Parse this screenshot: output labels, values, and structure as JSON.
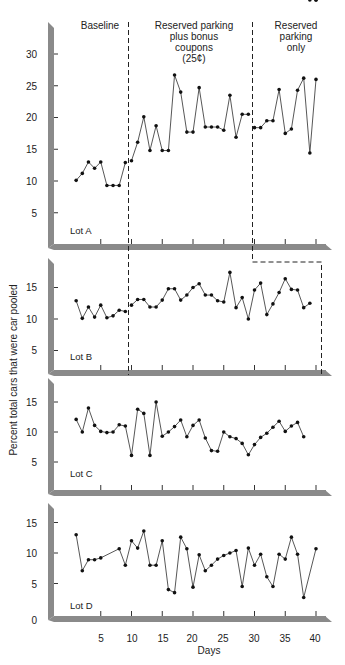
{
  "chart_data": {
    "type": "line",
    "title": "",
    "xlabel": "Days",
    "ylabel": "Percent total cars that were car pooled",
    "x_ticks": [
      5,
      10,
      15,
      20,
      25,
      30,
      35,
      40
    ],
    "phases": [
      {
        "label": "Baseline",
        "lines": [
          "Baseline"
        ]
      },
      {
        "label": "Reserved parking plus bonus coupons (25¢)",
        "lines": [
          "Reserved parking",
          "plus bonus",
          "coupons",
          "(25¢)"
        ]
      },
      {
        "label": "Reserved parking only",
        "lines": [
          "Reserved",
          "parking",
          "only"
        ]
      }
    ],
    "panels": [
      {
        "name": "Lot A",
        "y_ticks": [
          5,
          10,
          15,
          20,
          25,
          30
        ],
        "ylim": [
          0,
          35
        ],
        "phase_break_1": 9.5,
        "phase_break_2": 29.7,
        "series": [
          {
            "phase": "Baseline",
            "x": [
              1,
              2,
              3,
              4,
              5,
              6,
              7,
              8,
              9
            ],
            "y": [
              10.1,
              11.2,
              13.0,
              12.0,
              13.0,
              9.3,
              9.3,
              9.3,
              12.9
            ]
          },
          {
            "phase": "Reserved parking plus bonus coupons",
            "x": [
              10,
              11,
              12,
              13,
              14,
              15,
              16,
              17,
              18,
              19,
              20,
              21,
              22,
              23,
              24,
              25,
              26,
              27,
              28,
              29
            ],
            "y": [
              13.2,
              16.1,
              20.1,
              14.8,
              18.7,
              14.8,
              14.8,
              26.7,
              24.0,
              17.7,
              17.7,
              24.7,
              18.5,
              18.5,
              18.5,
              18.0,
              23.5,
              16.9,
              20.5,
              20.5
            ]
          },
          {
            "phase": "Reserved parking only",
            "x": [
              30,
              31,
              32,
              33,
              34,
              35,
              36,
              37,
              38,
              39,
              40
            ],
            "y": [
              18.4,
              18.4,
              19.5,
              19.5,
              24.4,
              17.5,
              18.2,
              24.3,
              26.2,
              14.4,
              26.0
            ]
          }
        ]
      },
      {
        "name": "Lot B",
        "y_ticks": [
          5,
          10,
          15
        ],
        "ylim": [
          0,
          18
        ],
        "phase_break_1": 9.5,
        "phase_break_2": 40.5,
        "series": [
          {
            "phase": "Baseline",
            "x": [
              1,
              2,
              3,
              4,
              5,
              6,
              7,
              8,
              9
            ],
            "y": [
              12.9,
              10.1,
              11.9,
              10.3,
              12.2,
              10.2,
              10.5,
              11.4,
              11.2
            ]
          },
          {
            "phase": "Reserved parking plus bonus coupons",
            "x": [
              10,
              11,
              12,
              13,
              14,
              15,
              16,
              17,
              18,
              19,
              20,
              21,
              22,
              23,
              24,
              25,
              26,
              27,
              28,
              29,
              30,
              31,
              32,
              33,
              34,
              35,
              36,
              37,
              38,
              39,
              40
            ],
            "y": [
              12.2,
              13.1,
              13.1,
              11.9,
              11.9,
              13.0,
              14.8,
              14.8,
              13.0,
              13.8,
              15.0,
              15.6,
              13.8,
              13.8,
              12.9,
              12.7,
              17.4,
              11.8,
              13.4,
              10.0,
              14.6,
              15.7,
              10.7,
              12.4,
              14.2,
              16.4,
              14.7,
              14.6,
              11.8,
              12.5
            ]
          }
        ]
      },
      {
        "name": "Lot C",
        "y_ticks": [
          5,
          10,
          15
        ],
        "ylim": [
          0,
          18
        ],
        "series": [
          {
            "phase": "all",
            "x": [
              1,
              2,
              3,
              4,
              5,
              6,
              7,
              8,
              9,
              10,
              11,
              12,
              13,
              14,
              15,
              16,
              17,
              18,
              19,
              20,
              21,
              22,
              23,
              24,
              25,
              26,
              27,
              28,
              29,
              30,
              31,
              32,
              33,
              34,
              35,
              36,
              37,
              38,
              39,
              40
            ],
            "y": [
              12.1,
              10.0,
              14.0,
              11.1,
              10.1,
              9.9,
              10.0,
              11.2,
              11.0,
              6.1,
              13.8,
              13.1,
              6.1,
              15.0,
              9.3,
              10.0,
              10.9,
              12.0,
              9.2,
              11.1,
              12.0,
              9.0,
              6.9,
              6.8,
              10.0,
              9.2,
              8.9,
              8.1,
              6.2,
              7.9,
              9.1,
              9.8,
              10.8,
              11.8,
              10.1,
              11.0,
              11.6,
              9.2
            ]
          }
        ]
      },
      {
        "name": "Lot D",
        "y_ticks": [
          0,
          5,
          10,
          15
        ],
        "ylim": [
          0,
          18
        ],
        "series": [
          {
            "phase": "all",
            "x": [
              1,
              2,
              3,
              4,
              5,
              8,
              9,
              10,
              11,
              12,
              13,
              14,
              15,
              16,
              17,
              18,
              19,
              20,
              21,
              22,
              23,
              24,
              25,
              26,
              27,
              28,
              29,
              30,
              31,
              32,
              33,
              34,
              35,
              36,
              37,
              38,
              40
            ],
            "y": [
              13.0,
              7.1,
              8.9,
              8.9,
              9.2,
              10.7,
              8.0,
              12.0,
              10.8,
              13.6,
              8.0,
              8.0,
              12.0,
              4.0,
              3.5,
              12.6,
              10.7,
              4.4,
              9.7,
              7.1,
              8.0,
              9.0,
              9.6,
              10.0,
              10.4,
              4.5,
              10.8,
              8.0,
              9.8,
              6.1,
              4.5,
              9.8,
              9.0,
              12.6,
              9.8,
              2.7,
              10.7
            ]
          }
        ]
      }
    ],
    "legend": null,
    "grid": false
  },
  "labels": {
    "phase_baseline": "Baseline",
    "phase_coupons_1": "Reserved parking",
    "phase_coupons_2": "plus bonus",
    "phase_coupons_3": "coupons",
    "phase_coupons_4": "(25¢)",
    "phase_reserved_1": "Reserved",
    "phase_reserved_2": "parking",
    "phase_reserved_3": "only",
    "lot_a": "Lot A",
    "lot_b": "Lot B",
    "lot_c": "Lot C",
    "lot_d": "Lot D",
    "ylabel": "Percent total cars that were car pooled",
    "xlabel": "Days",
    "y_tick_30": "30",
    "y_tick_25": "25",
    "y_tick_20": "20",
    "y_tick_15": "15",
    "y_tick_10": "10",
    "y_tick_5": "5",
    "y_tick_0": "0",
    "x_tick_5": "5",
    "x_tick_10": "10",
    "x_tick_15": "15",
    "x_tick_20": "20",
    "x_tick_25": "25",
    "x_tick_30": "30",
    "x_tick_35": "35",
    "x_tick_40": "40"
  },
  "colors": {
    "axis_bar": "#8a8a8a",
    "axis_bar_dark": "#6e6e6e",
    "line": "#444444",
    "point": "#111111",
    "dash": "#222222"
  }
}
